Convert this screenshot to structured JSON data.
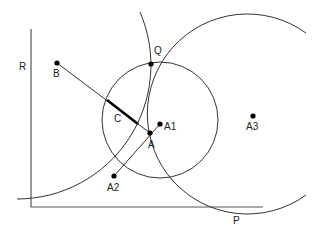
{
  "diagram": {
    "labels": {
      "R": "R",
      "B": "B",
      "Q": "Q",
      "C": "C",
      "A": "A",
      "A1": "A1",
      "A2": "A2",
      "A3": "A3",
      "P": "P"
    },
    "points": {
      "B": [
        57,
        63
      ],
      "Q": [
        151,
        64
      ],
      "A": [
        150,
        133
      ],
      "A1": [
        160,
        124
      ],
      "A2": [
        114,
        176
      ],
      "A3": [
        253,
        116
      ]
    },
    "colors": {
      "stroke": "#333333",
      "point": "#000000"
    }
  }
}
